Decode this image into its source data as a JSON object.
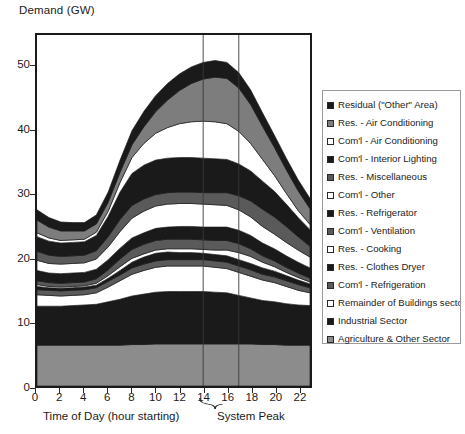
{
  "chart_data": {
    "type": "area",
    "title": "Demand (GW)",
    "ylabel": "Demand (GW)",
    "xlabel": "Time of Day (hour starting)",
    "annotation": "System Peak",
    "grid": false,
    "legend_position": "right",
    "ylim": [
      0,
      55
    ],
    "xlim": [
      0,
      23
    ],
    "yticks": [
      "0",
      "10",
      "20",
      "30",
      "40",
      "50"
    ],
    "ytick_values": [
      0,
      10,
      20,
      30,
      40,
      50
    ],
    "xticks": [
      "0",
      "2",
      "4",
      "6",
      "8",
      "10",
      "12",
      "14",
      "16",
      "18",
      "20",
      "22"
    ],
    "xtick_values": [
      0,
      2,
      4,
      6,
      8,
      10,
      12,
      14,
      16,
      18,
      20,
      22
    ],
    "x": [
      0,
      1,
      2,
      3,
      4,
      5,
      6,
      7,
      8,
      9,
      10,
      11,
      12,
      13,
      14,
      15,
      16,
      17,
      18,
      19,
      20,
      21,
      22,
      23
    ],
    "peak_marker_lines": [
      14,
      17
    ],
    "stack_order": "bottom_to_top",
    "series": [
      {
        "name": "Agriculture & Other Sector",
        "color": "#8c8c8c",
        "values": [
          6.4,
          6.4,
          6.4,
          6.4,
          6.4,
          6.4,
          6.4,
          6.4,
          6.5,
          6.5,
          6.6,
          6.6,
          6.6,
          6.6,
          6.6,
          6.6,
          6.6,
          6.6,
          6.6,
          6.5,
          6.5,
          6.4,
          6.4,
          6.4
        ]
      },
      {
        "name": "Industrial Sector",
        "color": "#1a1a1a",
        "values": [
          6.1,
          6.1,
          6.1,
          6.2,
          6.3,
          6.4,
          6.8,
          7.2,
          7.6,
          7.9,
          8.1,
          8.2,
          8.2,
          8.2,
          8.2,
          8.1,
          8.0,
          7.6,
          7.2,
          6.9,
          6.7,
          6.5,
          6.3,
          6.2
        ]
      },
      {
        "name": "Remainder of Buildings sector",
        "color": "#ffffff",
        "values": [
          1.8,
          1.7,
          1.6,
          1.6,
          1.6,
          1.8,
          2.3,
          2.9,
          3.4,
          3.7,
          3.9,
          4.0,
          4.0,
          4.0,
          4.0,
          3.9,
          3.8,
          3.6,
          3.4,
          3.2,
          3.0,
          2.7,
          2.3,
          2.0
        ]
      },
      {
        "name": "Com'l - Refrigeration",
        "color": "#5a5a5a",
        "values": [
          0.8,
          0.8,
          0.8,
          0.8,
          0.8,
          0.8,
          0.9,
          0.9,
          1.0,
          1.0,
          1.0,
          1.0,
          1.0,
          1.0,
          1.0,
          1.0,
          1.0,
          1.0,
          1.0,
          0.9,
          0.9,
          0.9,
          0.9,
          0.8
        ]
      },
      {
        "name": "Res. - Clothes Dryer",
        "color": "#1a1a1a",
        "values": [
          0.5,
          0.4,
          0.4,
          0.4,
          0.4,
          0.4,
          0.5,
          0.7,
          0.9,
          1.1,
          1.2,
          1.2,
          1.1,
          1.1,
          1.0,
          1.0,
          1.0,
          1.0,
          1.0,
          1.0,
          0.9,
          0.8,
          0.7,
          0.6
        ]
      },
      {
        "name": "Res. - Cooking",
        "color": "#ffffff",
        "values": [
          0.3,
          0.2,
          0.2,
          0.2,
          0.2,
          0.3,
          0.4,
          0.6,
          0.6,
          0.5,
          0.5,
          0.5,
          0.6,
          0.6,
          0.6,
          0.7,
          0.9,
          1.1,
          1.1,
          0.9,
          0.7,
          0.5,
          0.4,
          0.3
        ]
      },
      {
        "name": "Com'l - Ventilation",
        "color": "#5a5a5a",
        "values": [
          0.6,
          0.6,
          0.6,
          0.6,
          0.6,
          0.7,
          0.9,
          1.2,
          1.4,
          1.5,
          1.5,
          1.5,
          1.5,
          1.5,
          1.5,
          1.5,
          1.5,
          1.4,
          1.2,
          1.0,
          0.9,
          0.8,
          0.7,
          0.6
        ]
      },
      {
        "name": "Res. - Refrigerator",
        "color": "#1a1a1a",
        "values": [
          1.6,
          1.5,
          1.5,
          1.5,
          1.5,
          1.5,
          1.6,
          1.7,
          1.8,
          1.8,
          1.9,
          1.9,
          2.0,
          2.0,
          2.0,
          2.1,
          2.1,
          2.1,
          2.1,
          2.0,
          1.9,
          1.8,
          1.7,
          1.6
        ]
      },
      {
        "name": "Com'l - Other",
        "color": "#ffffff",
        "values": [
          1.6,
          1.5,
          1.5,
          1.5,
          1.5,
          1.6,
          2.0,
          2.6,
          3.1,
          3.4,
          3.5,
          3.6,
          3.6,
          3.6,
          3.6,
          3.5,
          3.4,
          3.2,
          2.9,
          2.6,
          2.3,
          2.1,
          1.9,
          1.7
        ]
      },
      {
        "name": "Res. - Miscellaneous",
        "color": "#5a5a5a",
        "values": [
          1.4,
          1.3,
          1.2,
          1.2,
          1.2,
          1.3,
          1.6,
          1.9,
          2.0,
          1.9,
          1.8,
          1.8,
          1.8,
          1.8,
          1.8,
          1.9,
          2.0,
          2.2,
          2.5,
          2.7,
          2.7,
          2.5,
          2.1,
          1.7
        ]
      },
      {
        "name": "Com'l - Interior Lighting",
        "color": "#1a1a1a",
        "values": [
          2.3,
          2.2,
          2.1,
          2.1,
          2.1,
          2.4,
          3.2,
          4.3,
          5.0,
          5.3,
          5.4,
          5.4,
          5.4,
          5.4,
          5.4,
          5.3,
          5.2,
          5.0,
          4.7,
          4.4,
          4.0,
          3.5,
          3.0,
          2.6
        ]
      },
      {
        "name": "Com'l - Air Conditioning",
        "color": "#ffffff",
        "values": [
          0.6,
          0.5,
          0.4,
          0.4,
          0.4,
          0.5,
          0.8,
          1.5,
          2.5,
          3.4,
          4.2,
          4.8,
          5.3,
          5.6,
          5.8,
          5.8,
          5.6,
          5.1,
          4.3,
          3.4,
          2.5,
          1.7,
          1.1,
          0.8
        ]
      },
      {
        "name": "Res. - Air Conditioning",
        "color": "#7d7d7d",
        "values": [
          2.0,
          1.7,
          1.5,
          1.4,
          1.3,
          1.3,
          1.4,
          1.6,
          2.0,
          2.6,
          3.4,
          4.3,
          5.2,
          6.0,
          6.6,
          7.0,
          7.1,
          6.8,
          6.1,
          5.2,
          4.4,
          3.7,
          3.1,
          2.5
        ]
      },
      {
        "name": "Residual (\"Other\" Area)",
        "color": "#1a1a1a",
        "values": [
          1.6,
          1.5,
          1.4,
          1.3,
          1.3,
          1.4,
          1.6,
          1.9,
          2.2,
          2.4,
          2.5,
          2.6,
          2.6,
          2.6,
          2.6,
          2.6,
          2.5,
          2.4,
          2.3,
          2.1,
          1.9,
          1.8,
          1.7,
          1.6
        ]
      }
    ],
    "legend_entries": [
      {
        "label": "Residual (\"Other\" Area)",
        "color": "#1a1a1a"
      },
      {
        "label": "Res. - Air Conditioning",
        "color": "#7d7d7d"
      },
      {
        "label": "Com'l - Air Conditioning",
        "color": "#ffffff"
      },
      {
        "label": "Com'l - Interior Lighting",
        "color": "#1a1a1a"
      },
      {
        "label": "Res. - Miscellaneous",
        "color": "#5a5a5a"
      },
      {
        "label": "Com'l - Other",
        "color": "#ffffff"
      },
      {
        "label": "Res. - Refrigerator",
        "color": "#1a1a1a"
      },
      {
        "label": "Com'l - Ventilation",
        "color": "#5a5a5a"
      },
      {
        "label": "Res. - Cooking",
        "color": "#ffffff"
      },
      {
        "label": "Res. - Clothes Dryer",
        "color": "#1a1a1a"
      },
      {
        "label": "Com'l - Refrigeration",
        "color": "#5a5a5a"
      },
      {
        "label": "Remainder of Buildings sector",
        "color": "#ffffff"
      },
      {
        "label": "Industrial Sector",
        "color": "#1a1a1a"
      },
      {
        "label": "Agriculture & Other Sector",
        "color": "#8c8c8c"
      }
    ]
  }
}
